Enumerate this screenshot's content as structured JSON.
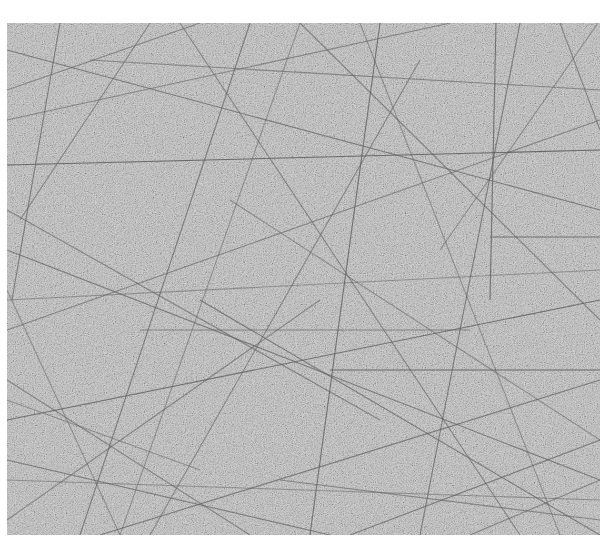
{
  "image": {
    "description": "Grayscale micrograph of a randomly oriented fiber mat / scratched granular surface",
    "canvas": {
      "width": 614,
      "height": 553,
      "background": "#ffffff"
    },
    "sample_region": {
      "x": 7,
      "y": 23,
      "width": 593,
      "height": 512,
      "base_color": "#b9b9b9",
      "grain_dark": "#8e8e8e",
      "grain_light": "#dadada"
    },
    "fiber_color": "#5e5e5e",
    "fibers": [
      [
        7,
        165,
        600,
        150,
        0.9
      ],
      [
        330,
        370,
        600,
        370,
        0.9
      ],
      [
        490,
        237,
        600,
        237,
        0.8
      ],
      [
        496,
        23,
        490,
        300,
        0.8
      ],
      [
        7,
        50,
        600,
        210,
        0.7
      ],
      [
        60,
        23,
        12,
        300,
        0.7
      ],
      [
        150,
        23,
        20,
        220,
        0.6
      ],
      [
        250,
        23,
        80,
        535,
        0.7
      ],
      [
        380,
        23,
        310,
        535,
        0.8
      ],
      [
        420,
        60,
        150,
        535,
        0.6
      ],
      [
        7,
        250,
        600,
        480,
        0.7
      ],
      [
        7,
        330,
        600,
        120,
        0.6
      ],
      [
        7,
        420,
        600,
        300,
        0.8
      ],
      [
        7,
        460,
        330,
        535,
        0.7
      ],
      [
        100,
        535,
        600,
        380,
        0.7
      ],
      [
        300,
        23,
        600,
        320,
        0.6
      ],
      [
        7,
        120,
        450,
        23,
        0.6
      ],
      [
        200,
        300,
        600,
        535,
        0.7
      ],
      [
        7,
        520,
        320,
        300,
        0.6
      ],
      [
        520,
        23,
        420,
        535,
        0.7
      ],
      [
        560,
        23,
        600,
        130,
        0.6
      ],
      [
        7,
        380,
        250,
        535,
        0.6
      ],
      [
        180,
        23,
        520,
        535,
        0.6
      ],
      [
        7,
        210,
        380,
        420,
        0.6
      ],
      [
        90,
        60,
        600,
        90,
        0.6
      ],
      [
        7,
        300,
        600,
        270,
        0.5
      ],
      [
        350,
        535,
        600,
        440,
        0.7
      ],
      [
        470,
        535,
        600,
        480,
        0.6
      ],
      [
        7,
        90,
        200,
        23,
        0.6
      ],
      [
        280,
        480,
        600,
        520,
        0.6
      ],
      [
        120,
        535,
        300,
        23,
        0.5
      ],
      [
        440,
        250,
        600,
        20,
        0.5
      ],
      [
        7,
        480,
        600,
        500,
        0.5
      ],
      [
        140,
        330,
        470,
        330,
        0.6
      ],
      [
        7,
        290,
        120,
        535,
        0.5
      ],
      [
        230,
        200,
        600,
        440,
        0.5
      ],
      [
        360,
        23,
        560,
        535,
        0.5
      ],
      [
        7,
        400,
        200,
        470,
        0.5
      ]
    ]
  }
}
